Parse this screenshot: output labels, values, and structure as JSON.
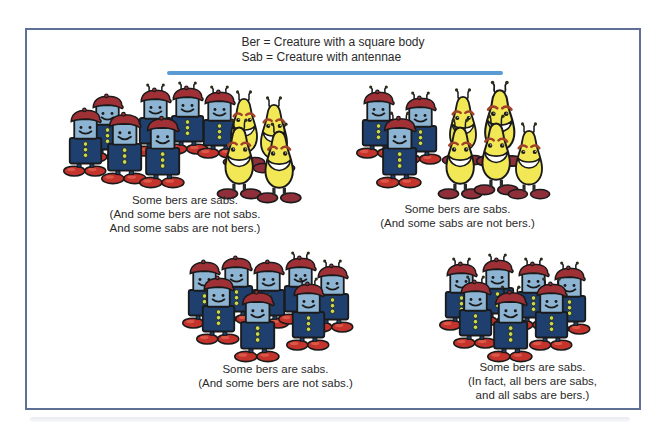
{
  "legend": {
    "line1": "Ber = Creature with a square body",
    "line2": "Sab = Creature with antennae"
  },
  "colors": {
    "ink": "#1a1a1a",
    "divider": "#5b9bd5",
    "frame-border": "#5f7096",
    "ber-head": "#8db4d2",
    "ber-body": "#1f3f6e",
    "ber-hat": "#9e3036",
    "ber-shoes": "#c5342c",
    "ber-buttons": "#c8d84f",
    "sab-body": "#f2e855",
    "sab-brow": "#a0422a",
    "sab-shoes": "#8e2f3a"
  },
  "groups": [
    {
      "id": "top-left",
      "caption": [
        "Some bers are sabs.",
        "(And some bers are not sabs.",
        "And some sabs are not bers.)"
      ],
      "creatures": [
        {
          "type": "ber",
          "antennae": true,
          "x": 78,
          "y": 2
        },
        {
          "type": "ber",
          "antennae": true,
          "x": 110,
          "y": 0
        },
        {
          "type": "ber",
          "antennae": true,
          "x": 142,
          "y": 4
        },
        {
          "type": "ber",
          "antennae": false,
          "x": 30,
          "y": 8
        },
        {
          "type": "ber",
          "antennae": false,
          "x": 8,
          "y": 22
        },
        {
          "type": "ber",
          "antennae": false,
          "x": 46,
          "y": 26,
          "s": 1.05
        },
        {
          "type": "ber",
          "antennae": false,
          "x": 84,
          "y": 30,
          "s": 1.05
        },
        {
          "type": "sab",
          "antennae": true,
          "x": 166,
          "y": 8
        },
        {
          "type": "sab",
          "antennae": true,
          "x": 196,
          "y": 14
        },
        {
          "type": "sab",
          "antennae": true,
          "x": 160,
          "y": 36,
          "s": 1.05
        },
        {
          "type": "sab",
          "antennae": true,
          "x": 200,
          "y": 40,
          "s": 1.05
        }
      ]
    },
    {
      "id": "top-right",
      "caption": [
        "Some bers are sabs.",
        "(And some sabs are not bers.)"
      ],
      "creatures": [
        {
          "type": "ber",
          "antennae": true,
          "x": 6,
          "y": 6
        },
        {
          "type": "ber",
          "antennae": true,
          "x": 48,
          "y": 12
        },
        {
          "type": "ber",
          "antennae": true,
          "x": 26,
          "y": 32,
          "s": 1.05
        },
        {
          "type": "sab",
          "antennae": true,
          "x": 90,
          "y": 8
        },
        {
          "type": "sab",
          "antennae": true,
          "x": 124,
          "y": 0,
          "s": 1.12
        },
        {
          "type": "sab",
          "antennae": true,
          "x": 86,
          "y": 38,
          "s": 1.05
        },
        {
          "type": "sab",
          "antennae": true,
          "x": 122,
          "y": 34,
          "s": 1.05
        },
        {
          "type": "sab",
          "antennae": true,
          "x": 156,
          "y": 42
        }
      ]
    },
    {
      "id": "bottom-left",
      "caption": [
        "Some bers are sabs.",
        "(And some bers are not sabs.)"
      ],
      "creatures": [
        {
          "type": "ber",
          "antennae": false,
          "x": 14,
          "y": 4
        },
        {
          "type": "ber",
          "antennae": false,
          "x": 46,
          "y": 0
        },
        {
          "type": "ber",
          "antennae": false,
          "x": 78,
          "y": 4
        },
        {
          "type": "ber",
          "antennae": true,
          "x": 110,
          "y": 0
        },
        {
          "type": "ber",
          "antennae": true,
          "x": 142,
          "y": 8
        },
        {
          "type": "ber",
          "antennae": false,
          "x": 28,
          "y": 20
        },
        {
          "type": "ber",
          "antennae": true,
          "x": 118,
          "y": 26
        },
        {
          "type": "ber",
          "antennae": false,
          "x": 66,
          "y": 34,
          "s": 1.05
        }
      ]
    },
    {
      "id": "bottom-right",
      "caption": [
        "Some bers are sabs.",
        "(In fact, all bers are sabs,",
        "and all sabs are bers.)"
      ],
      "creatures": [
        {
          "type": "ber",
          "antennae": true,
          "x": 14,
          "y": 6
        },
        {
          "type": "ber",
          "antennae": true,
          "x": 50,
          "y": 2
        },
        {
          "type": "ber",
          "antennae": true,
          "x": 86,
          "y": 6
        },
        {
          "type": "ber",
          "antennae": true,
          "x": 122,
          "y": 10
        },
        {
          "type": "ber",
          "antennae": true,
          "x": 28,
          "y": 24
        },
        {
          "type": "ber",
          "antennae": true,
          "x": 104,
          "y": 26
        },
        {
          "type": "ber",
          "antennae": true,
          "x": 62,
          "y": 34,
          "s": 1.05
        }
      ]
    }
  ]
}
